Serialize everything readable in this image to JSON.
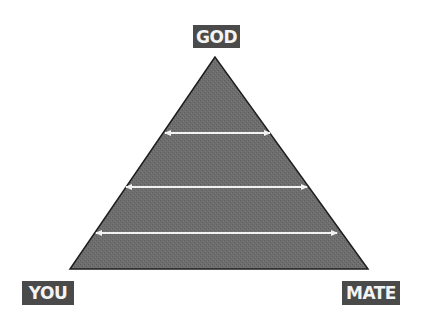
{
  "diagram": {
    "labels": {
      "top": "GOD",
      "bottom_left": "YOU",
      "bottom_right": "MATE"
    },
    "triangle": {
      "apex": [
        215,
        57
      ],
      "base_left": [
        70,
        269
      ],
      "base_right": [
        368,
        269
      ],
      "fill_color": "#6e6e6e",
      "stroke_color": "#1e1e1e"
    },
    "arrows": [
      {
        "y": 133,
        "x1": 163,
        "x2": 272
      },
      {
        "y": 187,
        "x1": 124,
        "x2": 309
      },
      {
        "y": 233,
        "x1": 94,
        "x2": 339
      }
    ],
    "arrow_color": "#f2f2f2",
    "label_bg_color": "#4a4a4a",
    "label_text_color": "#f4f4f4"
  }
}
